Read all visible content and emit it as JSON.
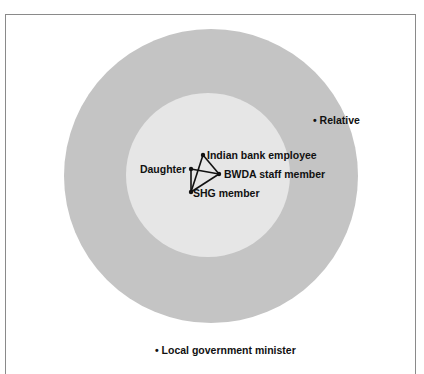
{
  "diagram": {
    "type": "concentric-network",
    "colors": {
      "outer_circle": "#c4c4c4",
      "inner_circle": "#e6e6e6",
      "background": "#ffffff",
      "frame": "#8a8a8a",
      "text": "#111111"
    },
    "rings": [
      {
        "name": "outer",
        "cx": 211,
        "cy": 176,
        "r": 147
      },
      {
        "name": "inner",
        "cx": 208,
        "cy": 175,
        "r": 82
      }
    ],
    "nodes": [
      {
        "id": "indian-bank-employee",
        "label": "Indian bank employee",
        "x": 203,
        "y": 155
      },
      {
        "id": "daughter",
        "label": "Daughter",
        "x": 191,
        "y": 169
      },
      {
        "id": "bwda-staff-member",
        "label": "BWDA staff member",
        "x": 219,
        "y": 174
      },
      {
        "id": "shg-member",
        "label": "SHG member",
        "x": 191,
        "y": 192
      },
      {
        "id": "relative",
        "label": "• Relative",
        "x": 313,
        "y": 120
      },
      {
        "id": "local-government-minister",
        "label": "• Local government minister",
        "x": 155,
        "y": 351
      }
    ],
    "edges": [
      [
        "indian-bank-employee",
        "bwda-staff-member"
      ],
      [
        "indian-bank-employee",
        "shg-member"
      ],
      [
        "daughter",
        "bwda-staff-member"
      ],
      [
        "daughter",
        "shg-member"
      ],
      [
        "shg-member",
        "bwda-staff-member"
      ]
    ]
  }
}
